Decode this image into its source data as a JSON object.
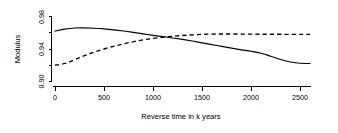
{
  "chart_data": {
    "type": "line",
    "title": "",
    "subtitle": "",
    "xlabel": "Reverse time in k years",
    "ylabel": "Modulus",
    "xlim": [
      0,
      2600
    ],
    "ylim": [
      0.895,
      0.982
    ],
    "grid": false,
    "legend_position": "none",
    "xticks": [
      0,
      500,
      1000,
      1500,
      2000,
      2500
    ],
    "xticklabels": [
      "0",
      "500",
      "1000",
      "1500",
      "2000",
      "2500"
    ],
    "yticks": [
      0.9,
      0.92,
      0.94,
      0.96,
      0.98
    ],
    "yticklabels": [
      "0.90",
      "",
      "0.94",
      "",
      "0.98"
    ],
    "ytick_labeled": [
      "0.90",
      "0.94",
      "0.98"
    ],
    "x": [
      0,
      100,
      200,
      300,
      400,
      500,
      600,
      700,
      800,
      900,
      1000,
      1100,
      1200,
      1300,
      1400,
      1500,
      1600,
      1700,
      1800,
      1900,
      2000,
      2100,
      2200,
      2300,
      2400,
      2500,
      2600
    ],
    "series": [
      {
        "name": "solid-curve",
        "style": "solid",
        "color": "#000000",
        "values": [
          0.962,
          0.9645,
          0.9658,
          0.966,
          0.9656,
          0.9648,
          0.9636,
          0.9621,
          0.9604,
          0.9586,
          0.9568,
          0.9552,
          0.9536,
          0.9518,
          0.9498,
          0.9476,
          0.9454,
          0.9432,
          0.941,
          0.939,
          0.9372,
          0.9348,
          0.931,
          0.927,
          0.924,
          0.9224,
          0.9222
        ]
      },
      {
        "name": "dashed-curve",
        "style": "dashed",
        "color": "#000000",
        "values": [
          0.92,
          0.9222,
          0.9268,
          0.9318,
          0.9362,
          0.94,
          0.9434,
          0.9464,
          0.949,
          0.9512,
          0.953,
          0.9544,
          0.9556,
          0.9566,
          0.9574,
          0.958,
          0.9584,
          0.9585,
          0.9585,
          0.9584,
          0.9583,
          0.9582,
          0.9581,
          0.9581,
          0.958,
          0.958,
          0.958
        ]
      }
    ]
  },
  "figure": {
    "background": "#ffffff",
    "foreground": "#000000"
  }
}
